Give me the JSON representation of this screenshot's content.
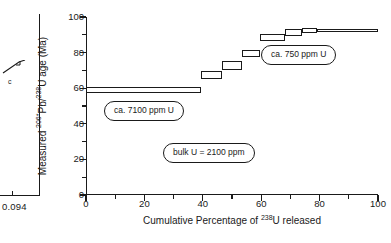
{
  "figure": {
    "left_fragment": {
      "corner_value": "0.094",
      "panel_letter": "c"
    }
  },
  "chart_data": {
    "type": "bar",
    "title": "",
    "subtitle": "",
    "xlabel_plain": "Cumulative Percentage of 238U released",
    "xlabel_prefix": "Cumulative Percentage of ",
    "xlabel_sup": "238",
    "xlabel_suffix": "U released",
    "ylabel_plain": "Measured 206*Pb/238U age (Ma)",
    "ylabel_part1": "Measured ",
    "ylabel_sup1": "206*",
    "ylabel_part2": "Pb/",
    "ylabel_sup2": "238",
    "ylabel_part3": "U age (Ma)",
    "xlim": [
      0,
      100
    ],
    "ylim": [
      0,
      100
    ],
    "xticks": [
      0,
      20,
      40,
      60,
      80,
      100
    ],
    "xminor": [
      10,
      30,
      50,
      70,
      90
    ],
    "yticks": [
      0,
      20,
      40,
      60,
      80,
      100
    ],
    "yminor": [
      10,
      30,
      50,
      70,
      90
    ],
    "grid": false,
    "legend": "none",
    "series_name": "step-leach age spectrum",
    "steps": [
      {
        "x_start": 0.0,
        "x_end": 39.5,
        "age_low": 57.5,
        "age_high": 60.5
      },
      {
        "x_start": 39.5,
        "x_end": 46.5,
        "age_low": 65.0,
        "age_high": 69.5
      },
      {
        "x_start": 46.5,
        "x_end": 53.5,
        "age_low": 70.5,
        "age_high": 75.5
      },
      {
        "x_start": 53.5,
        "x_end": 59.5,
        "age_low": 77.5,
        "age_high": 81.5
      },
      {
        "x_start": 59.5,
        "x_end": 68.0,
        "age_low": 86.5,
        "age_high": 90.5
      },
      {
        "x_start": 68.0,
        "x_end": 74.0,
        "age_low": 89.5,
        "age_high": 93.5
      },
      {
        "x_start": 74.0,
        "x_end": 79.0,
        "age_low": 91.0,
        "age_high": 94.0
      },
      {
        "x_start": 79.0,
        "x_end": 100.0,
        "age_low": 91.5,
        "age_high": 93.5
      }
    ],
    "annotations": [
      {
        "id": "low-u-domain",
        "text": "ca. 7100 ppm U"
      },
      {
        "id": "high-u-domain",
        "text": "ca. 750 ppm U"
      },
      {
        "id": "bulk-u",
        "text": "bulk U = 2100 ppm"
      }
    ]
  }
}
